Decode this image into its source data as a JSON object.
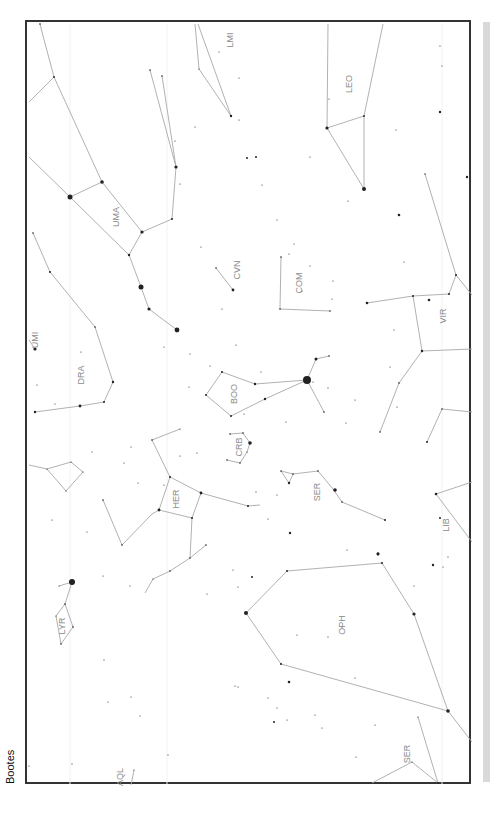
{
  "chart": {
    "title": "Bootes",
    "colors": {
      "frame": "#333333",
      "lines": "#a8a8a8",
      "labels": "#8a8a8a",
      "stars": "#222222",
      "scrollbar": "#d9d9d9"
    },
    "constellations": [
      {
        "abbr": "LMI"
      },
      {
        "abbr": "LEO"
      },
      {
        "abbr": "UMA"
      },
      {
        "abbr": "CVN"
      },
      {
        "abbr": "COM"
      },
      {
        "abbr": "UMI"
      },
      {
        "abbr": "DRA"
      },
      {
        "abbr": "BOO"
      },
      {
        "abbr": "VIR"
      },
      {
        "abbr": "CRB"
      },
      {
        "abbr": "SER"
      },
      {
        "abbr": "HER"
      },
      {
        "abbr": "LIB"
      },
      {
        "abbr": "LYR"
      },
      {
        "abbr": "OPH"
      },
      {
        "abbr": "SER"
      },
      {
        "abbr": "AQL"
      }
    ]
  }
}
